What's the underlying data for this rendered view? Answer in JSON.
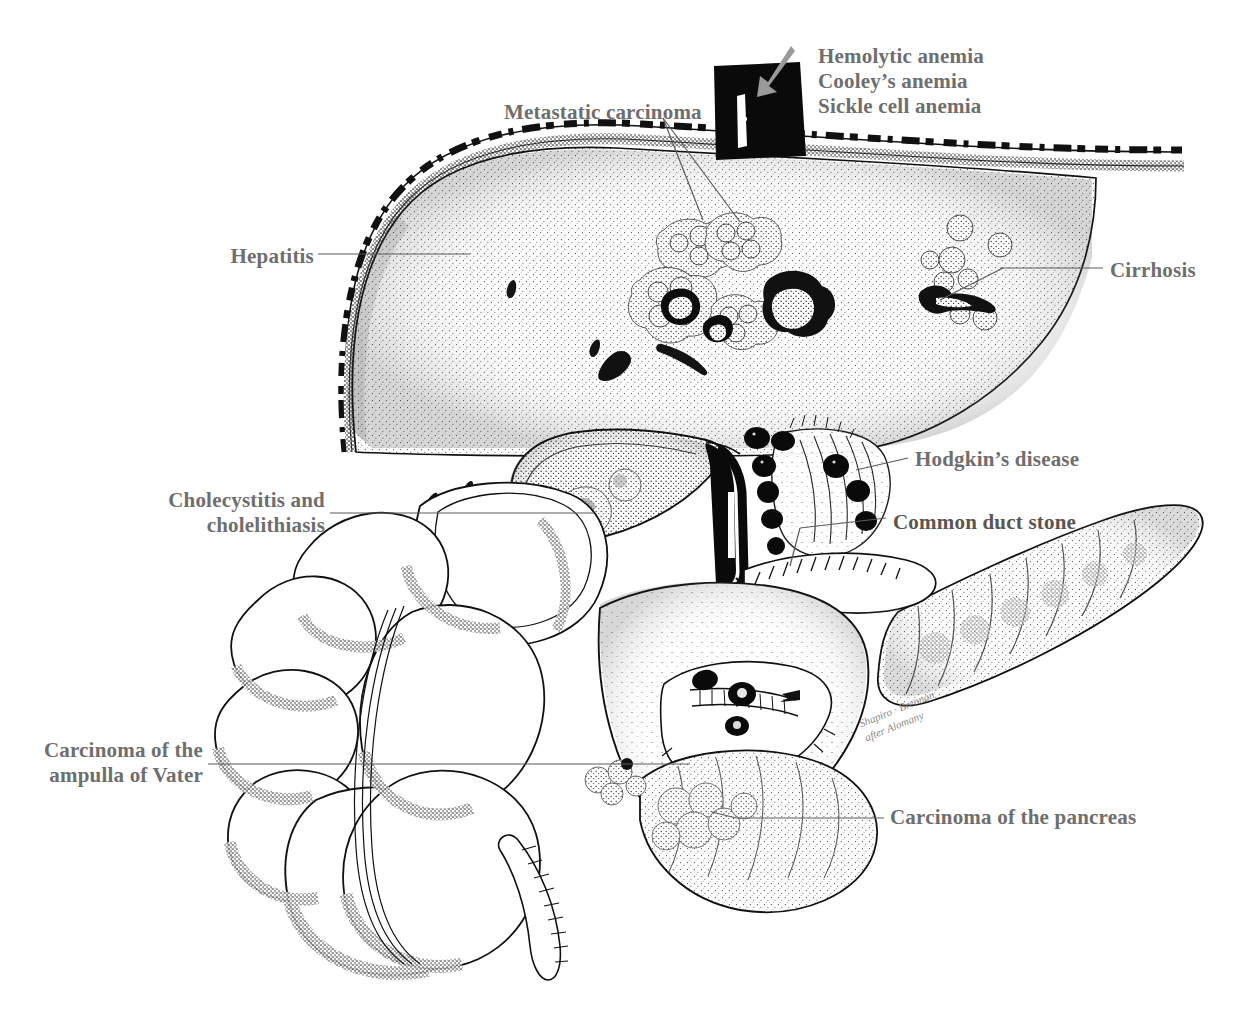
{
  "figure": {
    "kind": "anatomical-illustration",
    "background_color": "#ffffff",
    "ink_color": "#111111",
    "label_color": "#6e6e6e",
    "accent_arrow_color": "#9a9a9a"
  },
  "labels": [
    {
      "id": "hemolytic-anemias",
      "lines": [
        "Hemolytic anemia",
        "Cooley’s anemia",
        "Sickle cell anemia"
      ],
      "text": "Hemolytic anemia\nCooley’s anemia\nSickle cell anemia",
      "align": "left",
      "x": 818,
      "y": 44,
      "points_to": "hepatic-vessel-arrow"
    },
    {
      "id": "metastatic-carcinoma",
      "lines": [
        "Metastatic carcinoma"
      ],
      "text": "Metastatic carcinoma",
      "align": "left",
      "x": 504,
      "y": 100,
      "points_to": "liver-tumor-nodules"
    },
    {
      "id": "hepatitis",
      "lines": [
        "Hepatitis"
      ],
      "text": "Hepatitis",
      "align": "right",
      "x": 229,
      "y": 244,
      "points_to": "liver-parenchyma"
    },
    {
      "id": "cirrhosis",
      "lines": [
        "Cirrhosis"
      ],
      "text": "Cirrhosis",
      "align": "left",
      "x": 1110,
      "y": 258,
      "points_to": "right-lobe-nodules"
    },
    {
      "id": "hodgkins-disease",
      "lines": [
        "Hodgkin’s disease"
      ],
      "text": "Hodgkin’s disease",
      "align": "left",
      "x": 915,
      "y": 447,
      "points_to": "portal-lymph-nodes"
    },
    {
      "id": "cholecystitis-cholelithiasis",
      "lines": [
        "Cholecystitis and",
        "cholelithiasis"
      ],
      "text": "Cholecystitis and\ncholelithiasis",
      "align": "right",
      "x": 155,
      "y": 488,
      "points_to": "gallbladder"
    },
    {
      "id": "common-duct-stone",
      "lines": [
        "Common duct stone"
      ],
      "text": "Common duct stone",
      "align": "left",
      "x": 893,
      "y": 510,
      "points_to": "common-bile-duct"
    },
    {
      "id": "carcinoma-ampulla-of-vater",
      "lines": [
        "Carcinoma of the",
        "ampulla of Vater"
      ],
      "text": "Carcinoma of the\nampulla of Vater",
      "align": "right",
      "x": 33,
      "y": 738,
      "points_to": "ampulla-of-vater"
    },
    {
      "id": "carcinoma-of-the-pancreas",
      "lines": [
        "Carcinoma of the pancreas"
      ],
      "text": "Carcinoma of the pancreas",
      "align": "left",
      "x": 890,
      "y": 805,
      "points_to": "pancreatic-head-tumor"
    }
  ],
  "signature": {
    "line1": "Shapiro · Brennan",
    "line2": "after Alomany"
  },
  "structures": [
    {
      "id": "diaphragm",
      "name": "diaphragm"
    },
    {
      "id": "liver",
      "name": "liver"
    },
    {
      "id": "gallbladder",
      "name": "gallbladder"
    },
    {
      "id": "common-bile-duct",
      "name": "common bile duct"
    },
    {
      "id": "portal-lymph-nodes",
      "name": "portal lymph nodes"
    },
    {
      "id": "duodenum",
      "name": "duodenum"
    },
    {
      "id": "pancreas",
      "name": "pancreas"
    },
    {
      "id": "colon",
      "name": "colon"
    },
    {
      "id": "hepatic-vessel",
      "name": "hepatic vessel"
    }
  ]
}
